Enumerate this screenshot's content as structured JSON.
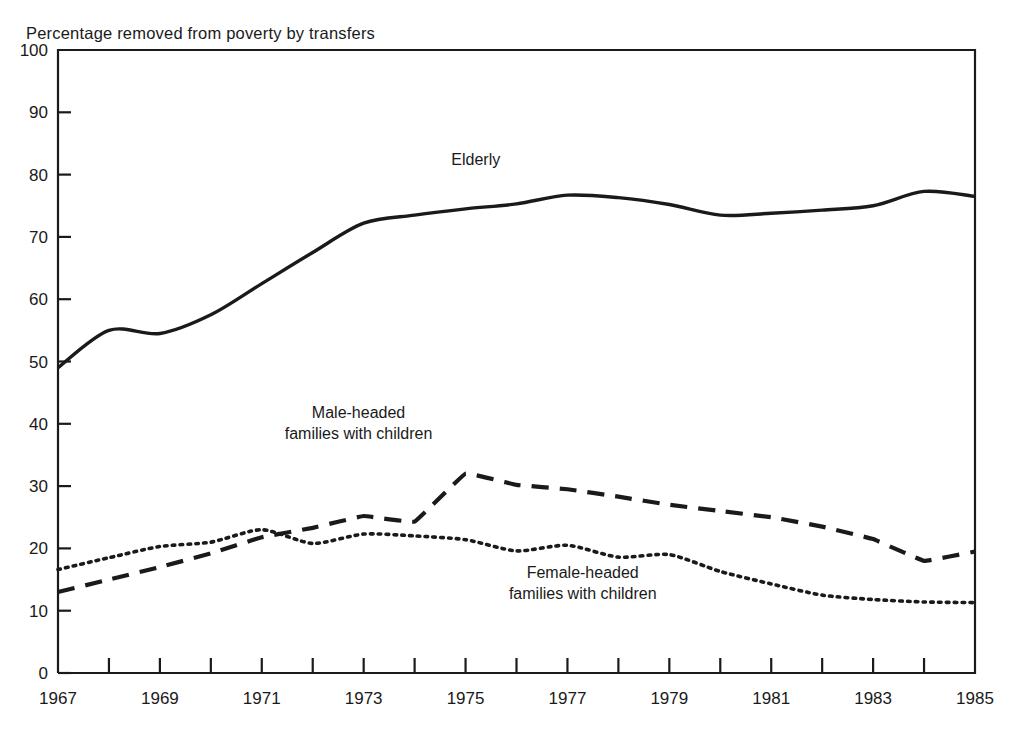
{
  "chart_data": {
    "type": "line",
    "title": "Percentage removed from poverty by transfers",
    "xlabel": "",
    "ylabel": "",
    "ylim": [
      0,
      100
    ],
    "xlim": [
      1967,
      1985
    ],
    "ytick_step": 10,
    "xtick_step": 1,
    "xlabel_step": 2,
    "grid": false,
    "legend": "inline-annotations",
    "yticks": [
      "0",
      "10",
      "20",
      "30",
      "40",
      "50",
      "60",
      "70",
      "80",
      "90",
      "100"
    ],
    "xticks": [
      1967,
      1968,
      1969,
      1970,
      1971,
      1972,
      1973,
      1974,
      1975,
      1976,
      1977,
      1978,
      1979,
      1980,
      1981,
      1982,
      1983,
      1984,
      1985
    ],
    "xticklabels": [
      "1967",
      "",
      "1969",
      "",
      "1971",
      "",
      "1973",
      "",
      "1975",
      "",
      "1977",
      "",
      "1979",
      "",
      "1981",
      "",
      "1983",
      "",
      "1985"
    ],
    "x": [
      1967,
      1968,
      1969,
      1970,
      1971,
      1972,
      1973,
      1974,
      1975,
      1976,
      1977,
      1978,
      1979,
      1980,
      1981,
      1982,
      1983,
      1984,
      1985
    ],
    "series": [
      {
        "name": "Elderly",
        "style": "solid",
        "color": "#1a1a1a",
        "label_x": 1975.2,
        "label_y": 81.5,
        "values": [
          49.0,
          55.0,
          54.5,
          57.5,
          62.5,
          67.5,
          72.2,
          73.5,
          74.5,
          75.3,
          76.7,
          76.3,
          75.2,
          73.5,
          73.8,
          74.3,
          75.0,
          77.3,
          76.5
        ]
      },
      {
        "name": "Male-headed\nfamilies with children",
        "label_line1": "Male-headed",
        "label_line2": "families with children",
        "style": "dashed",
        "color": "#1a1a1a",
        "label_x": 1972.9,
        "label_y": 41.0,
        "values": [
          13.0,
          15.0,
          17.0,
          19.2,
          21.8,
          23.3,
          25.2,
          24.3,
          32.0,
          30.2,
          29.5,
          28.3,
          27.0,
          26.0,
          25.0,
          23.5,
          21.5,
          18.0,
          19.5
        ]
      },
      {
        "name": "Female-headed\nfamilies with children",
        "label_line1": "Female-headed",
        "label_line2": "families with children",
        "style": "dotted",
        "color": "#1a1a1a",
        "label_x": 1977.3,
        "label_y": 15.2,
        "values": [
          16.6,
          18.5,
          20.3,
          21.0,
          23.0,
          20.8,
          22.3,
          22.0,
          21.4,
          19.6,
          20.5,
          18.6,
          19.0,
          16.3,
          14.3,
          12.5,
          11.8,
          11.4,
          11.3
        ]
      }
    ]
  }
}
